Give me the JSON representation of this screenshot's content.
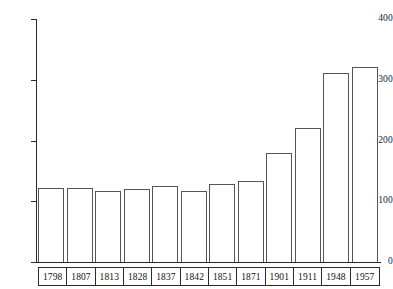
{
  "chart_data": {
    "type": "bar",
    "title": "",
    "subtitle": "",
    "xlabel": "",
    "ylabel": "",
    "categories": [
      "1798",
      "1807",
      "1813",
      "1828",
      "1837",
      "1842",
      "1851",
      "1871",
      "1901",
      "1911",
      "1948",
      "1957"
    ],
    "values": [
      121,
      121,
      117,
      120,
      125,
      117,
      128,
      133,
      179,
      220,
      311,
      321
    ],
    "ylim": [
      0,
      400
    ],
    "yticks": [
      0,
      100,
      200,
      300,
      400
    ],
    "ytick_labels": [
      "0",
      "100",
      "200",
      "300",
      "400"
    ],
    "grid": false,
    "legend": null,
    "series": [
      {
        "name": "",
        "values": [
          121,
          121,
          117,
          120,
          125,
          117,
          128,
          133,
          179,
          220,
          311,
          321
        ]
      }
    ],
    "colors": {
      "bar_stroke": "#565656",
      "bar_fill": "transparent",
      "axis": "#2a2a2a",
      "text": "#111111",
      "background": "#ffffff"
    }
  }
}
